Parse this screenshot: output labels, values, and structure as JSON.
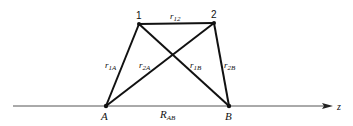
{
  "diagram": {
    "title": "",
    "axis": {
      "label": "z",
      "x_start": 13,
      "x_end": 332,
      "y": 106
    },
    "points": {
      "p1": {
        "label": "1",
        "x": 139,
        "y": 24
      },
      "p2": {
        "label": "2",
        "x": 214,
        "y": 23
      },
      "A": {
        "label": "A",
        "x": 106,
        "y": 106
      },
      "B": {
        "label": "B",
        "x": 229,
        "y": 106
      }
    },
    "edges": {
      "r12": {
        "main": "r",
        "sub": "12",
        "from": "p1",
        "to": "p2"
      },
      "r1A": {
        "main": "r",
        "sub": "1A",
        "from": "p1",
        "to": "A"
      },
      "r2A": {
        "main": "r",
        "sub": "2A",
        "from": "p2",
        "to": "A"
      },
      "r1B": {
        "main": "r",
        "sub": "1B",
        "from": "p1",
        "to": "B"
      },
      "r2B": {
        "main": "r",
        "sub": "2B",
        "from": "p2",
        "to": "B"
      },
      "RAB": {
        "main": "R",
        "sub": "AB",
        "from": "A",
        "to": "B"
      }
    },
    "colors": {
      "line": "#111111",
      "axis": "#555555",
      "background": "#ffffff"
    }
  }
}
